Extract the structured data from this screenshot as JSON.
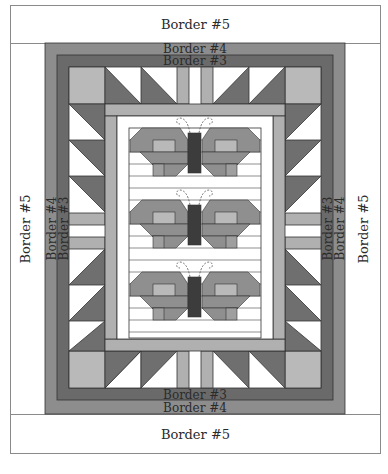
{
  "diagram": {
    "type": "quilt-layout",
    "borders": {
      "top_outer": "Border #5",
      "top_middle": "Border #4",
      "top_inner": "Border #3",
      "bottom_inner": "Border #3",
      "bottom_middle": "Border  #4",
      "bottom_outer": "Border #5",
      "left_outer": "Border #5",
      "left_middle": "Border #4",
      "left_inner": "Border #3",
      "right_inner": "Border #3",
      "right_middle": "Border #4",
      "right_outer": "Border #5"
    },
    "center": {
      "motif": "butterfly",
      "count": 3
    },
    "colors": {
      "border5": "#ffffff",
      "border4": "#8d8d8d",
      "border3": "#6a6a6a",
      "light_gray": "#b9b9b9",
      "mid_gray": "#8f8f8f",
      "dark_gray": "#5f5f5f",
      "body": "#3c3c3c",
      "outline": "#3a3a3a"
    }
  }
}
